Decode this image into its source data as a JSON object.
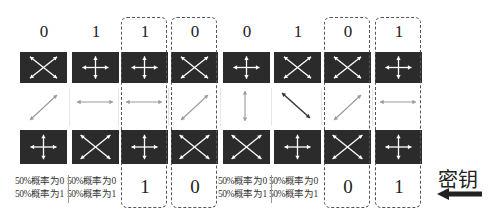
{
  "diagram": {
    "colors": {
      "box_fill": "#2b2b2b",
      "glyph": "#ffffff",
      "photon_light": "#9a9a9a",
      "photon_dark": "#333333",
      "dash": "#555555"
    },
    "columns": [
      {
        "sent_bit": "0",
        "sender_basis": "diagonal",
        "photon": "diag-45",
        "receiver_basis": "rectilinear",
        "result": [
          "50%概率为0",
          "50%概率为1"
        ],
        "kept": false
      },
      {
        "sent_bit": "1",
        "sender_basis": "rectilinear",
        "photon": "horizontal",
        "receiver_basis": "diagonal",
        "result": [
          "50%概率为0",
          "50%概率为1"
        ],
        "kept": false
      },
      {
        "sent_bit": "1",
        "sender_basis": "rectilinear",
        "photon": "horizontal",
        "receiver_basis": "rectilinear",
        "result": [
          "1"
        ],
        "kept": true
      },
      {
        "sent_bit": "0",
        "sender_basis": "diagonal",
        "photon": "diag-45",
        "receiver_basis": "diagonal",
        "result": [
          "0"
        ],
        "kept": true
      },
      {
        "sent_bit": "0",
        "sender_basis": "rectilinear",
        "photon": "vertical",
        "receiver_basis": "diagonal",
        "result": [
          "50%概率为0",
          "50%概率为1"
        ],
        "kept": false
      },
      {
        "sent_bit": "1",
        "sender_basis": "diagonal",
        "photon": "diag-135",
        "receiver_basis": "rectilinear",
        "result": [
          "50%概率为0",
          "50%概率为1"
        ],
        "kept": false
      },
      {
        "sent_bit": "0",
        "sender_basis": "diagonal",
        "photon": "diag-45",
        "receiver_basis": "diagonal",
        "result": [
          "0"
        ],
        "kept": true
      },
      {
        "sent_bit": "1",
        "sender_basis": "rectilinear",
        "photon": "horizontal",
        "receiver_basis": "rectilinear",
        "result": [
          "1"
        ],
        "kept": true
      }
    ],
    "key_label": "密钥",
    "key_arrow_icon": "left-arrow-icon"
  }
}
